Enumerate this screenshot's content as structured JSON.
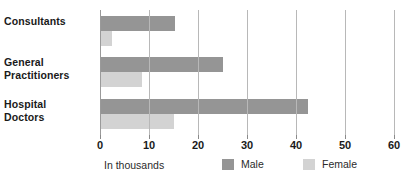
{
  "chart_data": {
    "type": "bar",
    "orientation": "horizontal",
    "title": "",
    "subtitle": "",
    "xlabel": "In thousands",
    "ylabel": "",
    "xlim": [
      0,
      60
    ],
    "xticks": [
      0,
      10,
      20,
      30,
      40,
      50,
      60
    ],
    "xtick_labels": [
      "0",
      "10",
      "20",
      "30",
      "40",
      "50",
      "60"
    ],
    "grid": true,
    "grid_axis": "x",
    "legend_position": "bottom",
    "categories": [
      "Consultants",
      "General Practitioners",
      "Hospital Doctors"
    ],
    "category_label_lines": [
      [
        "Consultants"
      ],
      [
        "General",
        "Practitioners"
      ],
      [
        "Hospital",
        "Doctors"
      ]
    ],
    "series": [
      {
        "name": "Male",
        "color": "#959595",
        "values": [
          15.3,
          25.1,
          42.5
        ]
      },
      {
        "name": "Female",
        "color": "#d3d3d3",
        "values": [
          2.5,
          8.5,
          15.2
        ]
      }
    ]
  },
  "legend": {
    "items": [
      {
        "label": "Male",
        "color": "#959595"
      },
      {
        "label": "Female",
        "color": "#d3d3d3"
      }
    ]
  },
  "axis_note": "In thousands",
  "colors": {
    "male": "#959595",
    "female": "#d3d3d3",
    "gridline": "#b8b8b8",
    "text": "#1a1a1a",
    "background": "#ffffff"
  }
}
